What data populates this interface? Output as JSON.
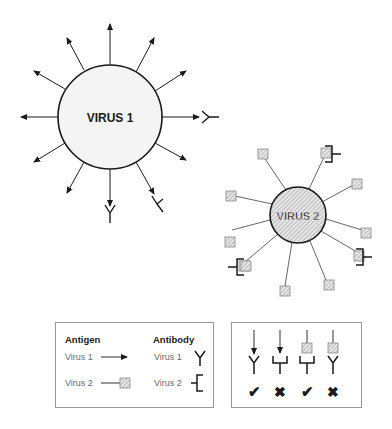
{
  "diagram": {
    "virus1": {
      "label": "VIRUS 1",
      "antigen_type": "arrow",
      "spike_count": 12,
      "bound_antibodies": 3
    },
    "virus2": {
      "label": "VIRUS 2",
      "antigen_type": "hatched-square",
      "spike_count": 12,
      "bound_antibodies": 3
    },
    "legend": {
      "antigen_heading": "Antigen",
      "antibody_heading": "Antibody",
      "rows": [
        {
          "antigen_label": "Virus 1",
          "antibody_label": "Virus 1"
        },
        {
          "antigen_label": "Virus 2",
          "antibody_label": "Virus 2"
        }
      ]
    },
    "binding_key": {
      "cases": [
        {
          "antigen": "arrow",
          "antibody": "Y",
          "result": "match",
          "symbol": "✔"
        },
        {
          "antigen": "arrow",
          "antibody": "bracket",
          "result": "no-match",
          "symbol": "✖"
        },
        {
          "antigen": "square",
          "antibody": "bracket",
          "result": "match",
          "symbol": "✔"
        },
        {
          "antigen": "square",
          "antibody": "Y",
          "result": "no-match",
          "symbol": "✖"
        }
      ]
    },
    "colors": {
      "stroke": "#1a1a1a",
      "virus1_fill": "#f4f4f4",
      "hatch_fill": "#dcdcdc",
      "box_border": "#9a9a9a",
      "light_text": "#6a6a6a"
    }
  }
}
